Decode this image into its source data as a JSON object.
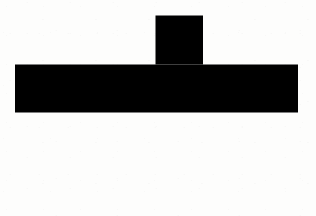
{
  "figure": {
    "background_color": "#fdfdfc",
    "stroke_color": "#1a1a1a",
    "fill_color": "#ffffff",
    "stroke_width": 2.2,
    "canvas": {
      "width": 316,
      "height": 216
    },
    "square_size": 47.5,
    "row": {
      "name": "horizontal-row",
      "square_count": 5,
      "left": 15,
      "top": 64.5,
      "right": 298,
      "bottom": 112.5,
      "cells": [
        {
          "label": "cell-1",
          "x": 15,
          "y": 64.5,
          "w": 47.5,
          "h": 48
        },
        {
          "label": "cell-2",
          "x": 62.5,
          "y": 64.5,
          "w": 46.5,
          "h": 48
        },
        {
          "label": "cell-3",
          "x": 109,
          "y": 64.5,
          "w": 46.5,
          "h": 48
        },
        {
          "label": "cell-4",
          "x": 155.5,
          "y": 64.5,
          "w": 47.5,
          "h": 48
        },
        {
          "label": "cell-5",
          "x": 203,
          "y": 64.5,
          "w": 47.5,
          "h": 48
        },
        {
          "label": "cell-6",
          "x": 250.5,
          "y": 64.5,
          "w": 47.5,
          "h": 48
        }
      ],
      "divider_x_positions": [
        62.5,
        109,
        155.5,
        203,
        250.5
      ]
    },
    "top_square": {
      "name": "top-square",
      "x": 155.5,
      "y": 15.5,
      "w": 47.5,
      "h": 49,
      "attached_above_cell_index": 4
    },
    "rule": {
      "name": "horizontal-rule",
      "x1": 21.5,
      "y1": 193.5,
      "x2": 300,
      "y2": 191.5,
      "stroke_width": 2.0
    }
  }
}
